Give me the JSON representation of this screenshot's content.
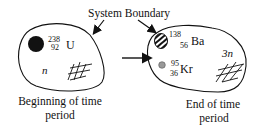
{
  "diagram": {
    "title_label": "System Boundary",
    "before": {
      "nucleus": {
        "mass": "238",
        "atomic": "92",
        "symbol": "U"
      },
      "neutron_label": "n",
      "caption_line1": "Beginning of time",
      "caption_line2": "period"
    },
    "after": {
      "nucleus1": {
        "mass": "138",
        "atomic": "56",
        "symbol": "Ba"
      },
      "nucleus2": {
        "mass": "95",
        "atomic": "36",
        "symbol": "Kr"
      },
      "neutron_label": "3n",
      "caption_line1": "End of time",
      "caption_line2": "period"
    }
  }
}
